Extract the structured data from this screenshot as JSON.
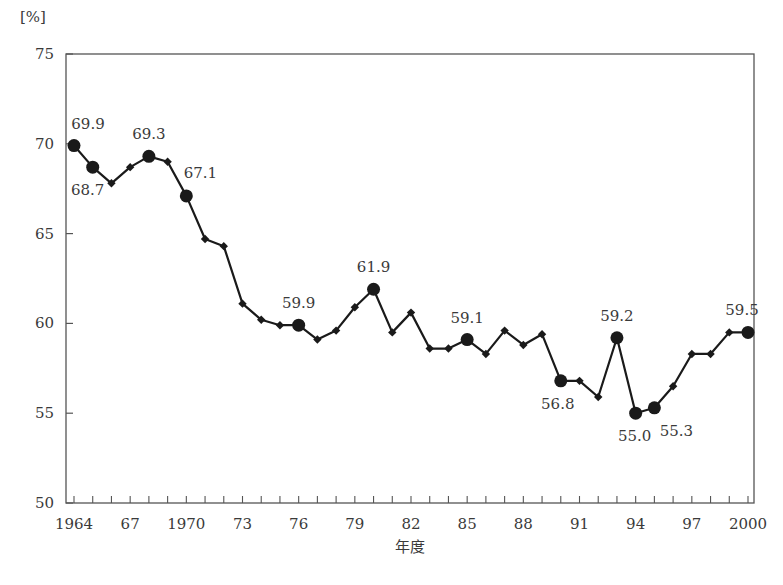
{
  "chart_data": {
    "type": "line",
    "title": "",
    "xlabel": "年度",
    "ylabel": "[%]",
    "ylim": [
      50,
      75
    ],
    "xlim": [
      1964,
      2000
    ],
    "grid": false,
    "legend": null,
    "y_ticks": [
      50,
      55,
      60,
      65,
      70,
      75
    ],
    "x_tick_labels": [
      {
        "year": 1964,
        "label": "1964"
      },
      {
        "year": 1967,
        "label": "67"
      },
      {
        "year": 1970,
        "label": "1970"
      },
      {
        "year": 1973,
        "label": "73"
      },
      {
        "year": 1976,
        "label": "76"
      },
      {
        "year": 1979,
        "label": "79"
      },
      {
        "year": 1982,
        "label": "82"
      },
      {
        "year": 1985,
        "label": "85"
      },
      {
        "year": 1988,
        "label": "88"
      },
      {
        "year": 1991,
        "label": "91"
      },
      {
        "year": 1994,
        "label": "94"
      },
      {
        "year": 1997,
        "label": "97"
      },
      {
        "year": 2000,
        "label": "2000"
      }
    ],
    "x": [
      1964,
      1965,
      1966,
      1967,
      1968,
      1969,
      1970,
      1971,
      1972,
      1973,
      1974,
      1975,
      1976,
      1977,
      1978,
      1979,
      1980,
      1981,
      1982,
      1983,
      1984,
      1985,
      1986,
      1987,
      1988,
      1989,
      1990,
      1991,
      1992,
      1993,
      1994,
      1995,
      1996,
      1997,
      1998,
      1999,
      2000
    ],
    "series": [
      {
        "name": "比率",
        "values": [
          69.9,
          68.7,
          67.8,
          68.7,
          69.3,
          69.0,
          67.1,
          64.7,
          64.3,
          61.1,
          60.2,
          59.9,
          59.9,
          59.1,
          59.6,
          60.9,
          61.9,
          59.5,
          60.6,
          58.6,
          58.6,
          59.1,
          58.3,
          59.6,
          58.8,
          59.4,
          56.8,
          56.8,
          55.9,
          59.2,
          55.0,
          55.3,
          56.5,
          58.3,
          58.3,
          59.5,
          59.5
        ]
      }
    ],
    "annotations": [
      {
        "year": 1964,
        "value": 69.9,
        "text": "69.9",
        "pos": "above"
      },
      {
        "year": 1965,
        "value": 68.7,
        "text": "68.7",
        "pos": "below"
      },
      {
        "year": 1968,
        "value": 69.3,
        "text": "69.3",
        "pos": "above"
      },
      {
        "year": 1970,
        "value": 67.1,
        "text": "67.1",
        "pos": "above-right"
      },
      {
        "year": 1976,
        "value": 59.9,
        "text": "59.9",
        "pos": "above"
      },
      {
        "year": 1980,
        "value": 61.9,
        "text": "61.9",
        "pos": "above"
      },
      {
        "year": 1985,
        "value": 59.1,
        "text": "59.1",
        "pos": "above"
      },
      {
        "year": 1990,
        "value": 56.8,
        "text": "56.8",
        "pos": "below"
      },
      {
        "year": 1993,
        "value": 59.2,
        "text": "59.2",
        "pos": "above"
      },
      {
        "year": 1994,
        "value": 55.0,
        "text": "55.0",
        "pos": "below"
      },
      {
        "year": 1995,
        "value": 55.3,
        "text": "55.3",
        "pos": "below-right"
      },
      {
        "year": 2000,
        "value": 59.5,
        "text": "59.5",
        "pos": "above"
      }
    ]
  },
  "colors": {
    "line": "#1a1a1a",
    "axis": "#555555",
    "text": "#3a3a3a"
  }
}
